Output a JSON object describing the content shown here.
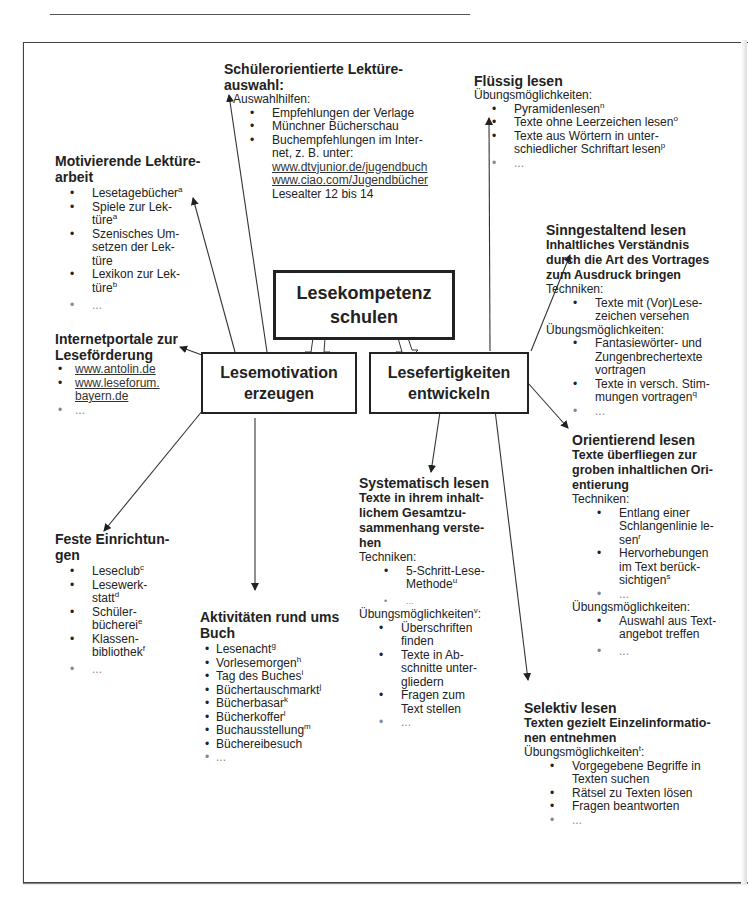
{
  "center": {
    "title_l1": "Lesekompetenz",
    "title_l2": "schulen"
  },
  "left_box": {
    "l1": "Lesemotivation",
    "l2": "erzeugen"
  },
  "right_box": {
    "l1": "Lesefertigkeiten",
    "l2": "entwickeln"
  },
  "schuelerorientiert": {
    "title_l1": "Schülerorientierte Lektüre-",
    "title_l2": "auswahl:",
    "label": "Auswahlhilfen:",
    "items": [
      "Empfehlungen der Verlage",
      "Münchner Bücherschau",
      "Buchempfehlungen im Inter-",
      "net, z. B. unter:"
    ],
    "links": [
      "www.dtvjunior.de/jugendbuch",
      "www.ciao.com/Jugendbücher"
    ],
    "note": "Lesealter 12 bis 14"
  },
  "fluessig": {
    "title": "Flüssig lesen",
    "label": "Übungsmöglichkeiten:",
    "items": [
      {
        "text": "Pyramidenlesen",
        "sup": "n"
      },
      {
        "text": "Texte ohne Leerzeichen lesen",
        "sup": "o"
      },
      {
        "text": "Texte aus Wörtern in unter-",
        "text2": "schiedlicher Schriftart lesen",
        "sup": "p"
      },
      {
        "text": "..."
      }
    ]
  },
  "motivierend": {
    "title_l1": "Motivierende Lektüre-",
    "title_l2": "arbeit",
    "items": [
      {
        "lines": [
          "Lesetagebücher"
        ],
        "sup": "a"
      },
      {
        "lines": [
          "Spiele zur Lek-",
          "türe"
        ],
        "sup": "a"
      },
      {
        "lines": [
          "Szenisches Um-",
          "setzen der Lek-",
          "türe"
        ],
        "sup": ""
      },
      {
        "lines": [
          "Lexikon zur Lek-",
          "türe"
        ],
        "sup": "b"
      },
      {
        "lines": [
          "..."
        ],
        "sup": ""
      }
    ]
  },
  "internetportale": {
    "title_l1": "Internetportale zur",
    "title_l2": "Leseförderung",
    "links": [
      "www.antolin.de",
      "www.leseforum.",
      "bayern.de"
    ],
    "more": "..."
  },
  "sinngestaltend": {
    "title": "Sinngestaltend lesen",
    "sub": [
      "Inhaltliches Verständnis",
      "durch die Art des Vortrages",
      "zum Ausdruck bringen"
    ],
    "label1": "Techniken:",
    "tech": [
      [
        "Texte mit (Vor)Lese-",
        "zeichen versehen"
      ]
    ],
    "label2": "Übungsmöglichkeiten:",
    "items": [
      {
        "lines": [
          "Fantasiewörter- und",
          "Zungenbrechertexte",
          "vortragen"
        ],
        "sup": ""
      },
      {
        "lines": [
          "Texte in versch. Stim-",
          "mungen vortragen"
        ],
        "sup": "q"
      },
      {
        "lines": [
          "..."
        ],
        "sup": ""
      }
    ]
  },
  "feste": {
    "title_l1": "Feste Einrichtun-",
    "title_l2": "gen",
    "items": [
      {
        "lines": [
          "Leseclub"
        ],
        "sup": "c"
      },
      {
        "lines": [
          "Lesewerk-",
          "statt"
        ],
        "sup": "d"
      },
      {
        "lines": [
          "Schüler-",
          "bücherei"
        ],
        "sup": "e"
      },
      {
        "lines": [
          "Klassen-",
          "bibliothek"
        ],
        "sup": "f"
      },
      {
        "lines": [
          "..."
        ],
        "sup": ""
      }
    ]
  },
  "aktivitaeten": {
    "title_l1": "Aktivitäten rund ums",
    "title_l2": "Buch",
    "items": [
      {
        "text": "Lesenacht",
        "sup": "g"
      },
      {
        "text": "Vorlesemorgen",
        "sup": "h"
      },
      {
        "text": "Tag des Buches",
        "sup": "i"
      },
      {
        "text": "Büchertauschmarkt",
        "sup": "j"
      },
      {
        "text": "Bücherbasar",
        "sup": "k"
      },
      {
        "text": "Bücherkoffer",
        "sup": "l"
      },
      {
        "text": "Buchausstellung",
        "sup": "m"
      },
      {
        "text": "Büchereibesuch",
        "sup": ""
      },
      {
        "text": "...",
        "sup": ""
      }
    ]
  },
  "systematisch": {
    "title": "Systematisch lesen",
    "sub": [
      "Texte in ihrem inhalt-",
      "lichem Gesamtzu-",
      "sammenhang verste-",
      "hen"
    ],
    "label1": "Techniken:",
    "tech": [
      {
        "lines": [
          "5-Schritt-Lese-",
          "Methode"
        ],
        "sup": "u"
      },
      {
        "lines": [
          "..."
        ],
        "sup": ""
      }
    ],
    "label2": "Übungsmöglichkeiten",
    "label2_sup": "v",
    "items": [
      [
        "Überschriften",
        "finden"
      ],
      [
        "Texte in Ab-",
        "schnitte unter-",
        "gliedern"
      ],
      [
        "Fragen zum",
        "Text stellen"
      ],
      [
        "..."
      ]
    ]
  },
  "orientierend": {
    "title": "Orientierend lesen",
    "sub": [
      "Texte überfliegen zur",
      "groben inhaltlichen Ori-",
      "entierung"
    ],
    "label1": "Techniken:",
    "tech": [
      {
        "lines": [
          "Entlang einer",
          "Schlangenlinie le-",
          "sen"
        ],
        "sup": "r"
      },
      {
        "lines": [
          "Hervorhebungen",
          "im Text berück-",
          "sichtigen"
        ],
        "sup": "s"
      },
      {
        "lines": [
          "..."
        ],
        "sup": ""
      }
    ],
    "label2": "Übungsmöglichkeiten:",
    "items": [
      [
        "Auswahl aus Text-",
        "angebot treffen"
      ],
      [
        "..."
      ]
    ]
  },
  "selektiv": {
    "title": "Selektiv lesen",
    "sub": [
      "Texten gezielt Einzelinformatio-",
      "nen entnehmen"
    ],
    "label": "Übungsmöglichkeiten",
    "label_sup": "t",
    "items": [
      [
        "Vorgegebene Begriffe in",
        "Texten suchen"
      ],
      [
        "Rätsel zu Texten lösen"
      ],
      [
        "Fragen beantworten"
      ],
      [
        "..."
      ]
    ]
  }
}
